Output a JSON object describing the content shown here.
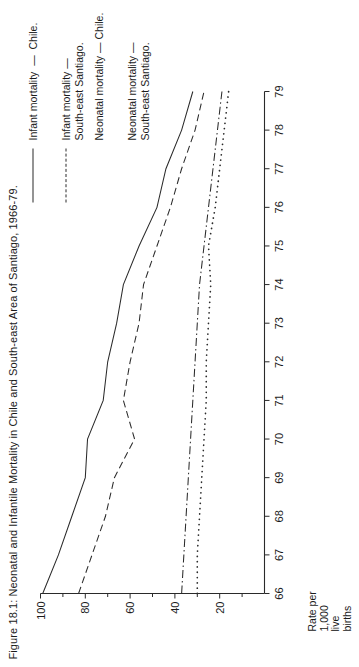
{
  "figure": {
    "title": "Figure 18.1: Neonatal and Infantile Mortality in Chile and South-east Area of Santiago, 1966-79."
  },
  "axes": {
    "y_label": "Rate per\n1,000\nlive\nbirths",
    "y_ticks": [
      "100",
      "80",
      "60",
      "40",
      "20"
    ],
    "x_ticks": [
      "66",
      "67",
      "68",
      "69",
      "70",
      "71",
      "72",
      "73",
      "74",
      "75",
      "76",
      "77",
      "78",
      "79"
    ]
  },
  "legend": {
    "items": [
      {
        "style": "solid",
        "label": "Infant mortality  —  Chile."
      },
      {
        "style": "dash",
        "label": "Infant mortality —\nSouth-east Santiago."
      },
      {
        "style": "dashdot",
        "label": "Neonatal mortality — Chile."
      },
      {
        "style": "dot",
        "label": "Neonatal mortality —\nSouth-east Santiago."
      }
    ]
  },
  "chart_data": {
    "type": "line",
    "title": "Figure 18.1: Neonatal and Infantile Mortality in Chile and South-east Area of Santiago, 1966-79.",
    "xlabel": "",
    "ylabel": "Rate per 1,000 live births",
    "x": [
      66,
      67,
      68,
      69,
      70,
      71,
      72,
      73,
      74,
      75,
      76,
      77,
      78,
      79
    ],
    "xlim": [
      66,
      79
    ],
    "ylim": [
      0,
      100
    ],
    "y_major_ticks": [
      20,
      40,
      60,
      80,
      100
    ],
    "y_minor_ticks": [
      10,
      30,
      50,
      70,
      90
    ],
    "grid": false,
    "legend_position": "right",
    "series": [
      {
        "name": "Infant mortality — Chile.",
        "style": "solid",
        "values": [
          99,
          92,
          86,
          80,
          79,
          72,
          70,
          66,
          63,
          56,
          48,
          44,
          37,
          32
        ]
      },
      {
        "name": "Infant mortality — South-east Santiago.",
        "style": "dash",
        "values": [
          83,
          77,
          71,
          67,
          58,
          63,
          60,
          56,
          54,
          48,
          42,
          37,
          31,
          27
        ]
      },
      {
        "name": "Neonatal mortality — Chile.",
        "style": "dashdot",
        "values": [
          37,
          36,
          35,
          34,
          33,
          32,
          31,
          30,
          29,
          27,
          25,
          23,
          21,
          19
        ]
      },
      {
        "name": "Neonatal mortality — South-east Santiago.",
        "style": "dot",
        "values": [
          30,
          30,
          29,
          28,
          27,
          26,
          26,
          25,
          24,
          25,
          22,
          20,
          18,
          16
        ]
      }
    ]
  }
}
